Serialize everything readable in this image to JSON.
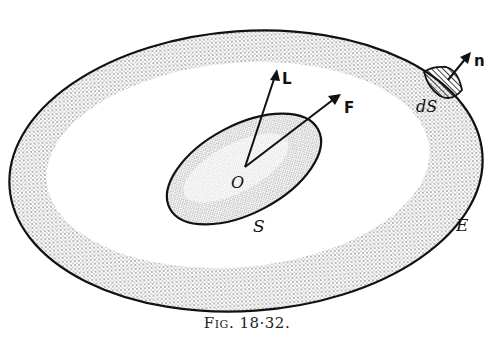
{
  "figure": {
    "caption_prefix": "Fig.",
    "caption_number": "18·32.",
    "labels": {
      "L": "L",
      "F": "F",
      "n": "n",
      "dS": "dS",
      "O": "O",
      "S": "S",
      "E": "E"
    },
    "elements": {
      "outer_region": "E",
      "inner_region": "S",
      "surface_element": "dS",
      "origin": "O",
      "vectors": [
        "L",
        "F",
        "n"
      ]
    },
    "colors": {
      "line": "#111111",
      "stipple": "#333333",
      "background": "#ffffff"
    }
  }
}
